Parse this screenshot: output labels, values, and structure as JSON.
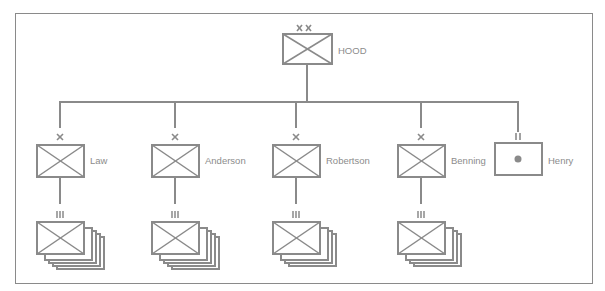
{
  "diagram": {
    "type": "military-order-of-battle",
    "colors": {
      "line": "#8a8a8a",
      "label": "#8c8c8c",
      "background": "#ffffff"
    },
    "headquarters": {
      "label": "HOOD",
      "echelon": "XX",
      "symbol": "infantry"
    },
    "subordinates": [
      {
        "label": "Law",
        "echelon": "X",
        "symbol": "infantry",
        "child_echelon": "III",
        "child_symbol": "infantry",
        "child_count": 5
      },
      {
        "label": "Anderson",
        "echelon": "X",
        "symbol": "infantry",
        "child_echelon": "III",
        "child_symbol": "infantry",
        "child_count": 5
      },
      {
        "label": "Robertson",
        "echelon": "X",
        "symbol": "infantry",
        "child_echelon": "III",
        "child_symbol": "infantry",
        "child_count": 4
      },
      {
        "label": "Benning",
        "echelon": "X",
        "symbol": "infantry",
        "child_echelon": "III",
        "child_symbol": "infantry",
        "child_count": 4
      },
      {
        "label": "Henry",
        "echelon": "II",
        "symbol": "artillery"
      }
    ]
  }
}
